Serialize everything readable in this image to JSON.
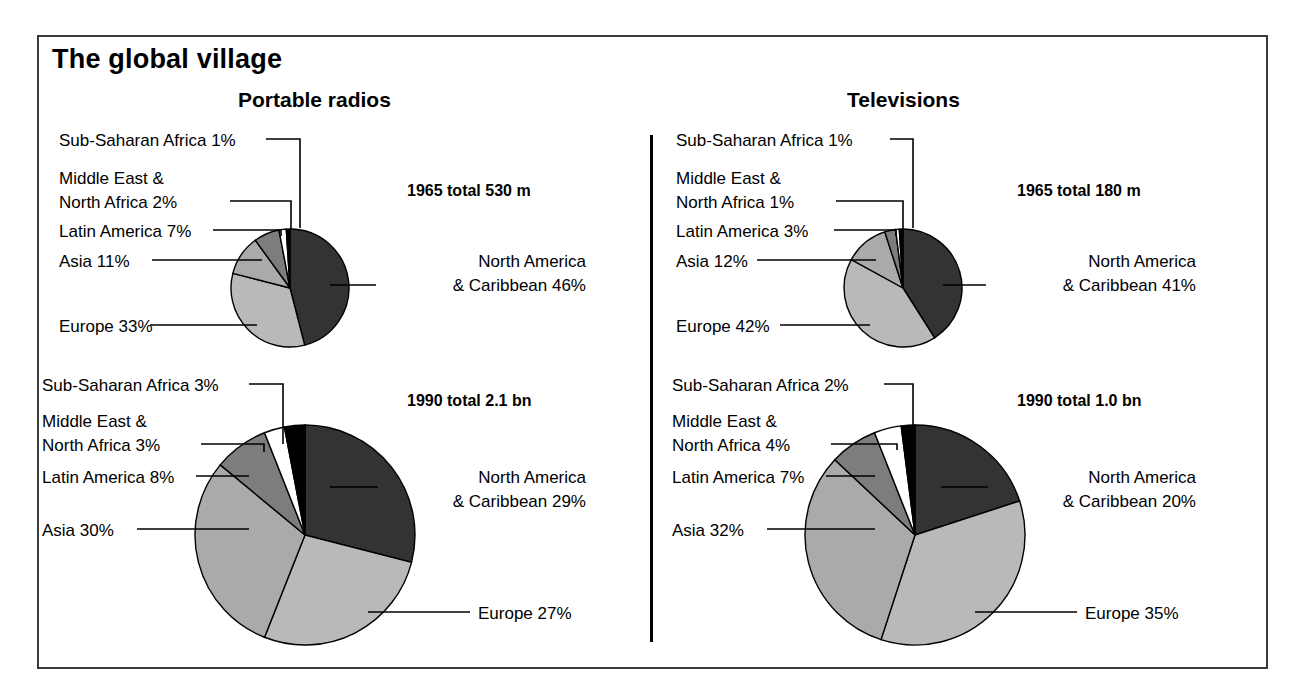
{
  "title": "The global village",
  "columns": [
    {
      "key": "radios",
      "label": "Portable radios"
    },
    {
      "key": "tv",
      "label": "Televisions"
    }
  ],
  "totals": {
    "radios_1965": "1965 total 530 m",
    "radios_1990": "1990 total 2.1 bn",
    "tv_1965": "1965 total 180 m",
    "tv_1990": "1990 total 1.0 bn"
  },
  "labels": {
    "radios_1965": {
      "sub_saharan": "Sub-Saharan Africa 1%",
      "middle_east_1": "Middle East &",
      "middle_east_2": "North Africa 2%",
      "latin": "Latin America 7%",
      "asia": "Asia 11%",
      "europe": "Europe 33%",
      "north_america_1": "North America",
      "north_america_2": "& Caribbean 46%"
    },
    "radios_1990": {
      "sub_saharan": "Sub-Saharan Africa 3%",
      "middle_east_1": "Middle East &",
      "middle_east_2": "North Africa 3%",
      "latin": "Latin America 8%",
      "asia": "Asia 30%",
      "europe": "Europe 27%",
      "north_america_1": "North America",
      "north_america_2": "& Caribbean 29%"
    },
    "tv_1965": {
      "sub_saharan": "Sub-Saharan Africa 1%",
      "middle_east_1": "Middle East &",
      "middle_east_2": "North Africa 1%",
      "latin": "Latin America 3%",
      "asia": "Asia 12%",
      "europe": "Europe 42%",
      "north_america_1": "North America",
      "north_america_2": "& Caribbean 41%"
    },
    "tv_1990": {
      "sub_saharan": "Sub-Saharan Africa 2%",
      "middle_east_1": "Middle East &",
      "middle_east_2": "North Africa 4%",
      "latin": "Latin America 7%",
      "asia": "Asia 32%",
      "europe": "Europe 35%",
      "north_america_1": "North America",
      "north_america_2": "& Caribbean 20%"
    }
  },
  "colors": {
    "north_america": "#333333",
    "europe": "#b9b9b9",
    "asia": "#aaaaaa",
    "latin_america": "#7d7d7d",
    "middle_east": "#ffffff",
    "sub_saharan": "#000000",
    "outline": "#000000",
    "frame": "#3a3a3a"
  },
  "chart_data": {
    "type": "pie",
    "title": "The global village",
    "legend_position": "callout-labels",
    "grid": false,
    "slice_order_clockwise_from_12": [
      "North America & Caribbean",
      "Europe",
      "Asia",
      "Latin America",
      "Middle East & North Africa",
      "Sub-Saharan Africa"
    ],
    "charts": [
      {
        "id": "radios_1965",
        "group": "Portable radios",
        "year": 1965,
        "total_label": "1965 total 530 m",
        "total_value": 530,
        "total_unit": "million",
        "radius_px": 59,
        "categories": [
          "North America & Caribbean",
          "Europe",
          "Asia",
          "Latin America",
          "Middle East & North Africa",
          "Sub-Saharan Africa"
        ],
        "values": [
          46,
          33,
          11,
          7,
          2,
          1
        ],
        "unit": "percent"
      },
      {
        "id": "radios_1990",
        "group": "Portable radios",
        "year": 1990,
        "total_label": "1990 total 2.1 bn",
        "total_value": 2.1,
        "total_unit": "billion",
        "radius_px": 110,
        "categories": [
          "North America & Caribbean",
          "Europe",
          "Asia",
          "Latin America",
          "Middle East & North Africa",
          "Sub-Saharan Africa"
        ],
        "values": [
          29,
          27,
          30,
          8,
          3,
          3
        ],
        "unit": "percent"
      },
      {
        "id": "tv_1965",
        "group": "Televisions",
        "year": 1965,
        "total_label": "1965 total 180 m",
        "total_value": 180,
        "total_unit": "million",
        "radius_px": 59,
        "categories": [
          "North America & Caribbean",
          "Europe",
          "Asia",
          "Latin America",
          "Middle East & North Africa",
          "Sub-Saharan Africa"
        ],
        "values": [
          41,
          42,
          12,
          3,
          1,
          1
        ],
        "unit": "percent"
      },
      {
        "id": "tv_1990",
        "group": "Televisions",
        "year": 1990,
        "total_label": "1990 total 1.0 bn",
        "total_value": 1.0,
        "total_unit": "billion",
        "radius_px": 110,
        "categories": [
          "North America & Caribbean",
          "Europe",
          "Asia",
          "Latin America",
          "Middle East & North Africa",
          "Sub-Saharan Africa"
        ],
        "values": [
          20,
          35,
          32,
          7,
          4,
          2
        ],
        "unit": "percent"
      }
    ]
  }
}
